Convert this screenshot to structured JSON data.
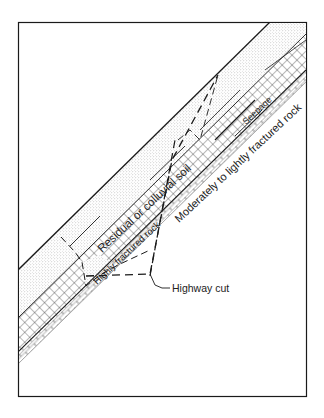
{
  "diagram": {
    "type": "geologic-cross-section",
    "layers": [
      {
        "id": "soil",
        "label": "Residual or colluvial soil",
        "pattern": "stipple"
      },
      {
        "id": "highly-fractured",
        "label": "Highly fractured rock",
        "pattern": "crosshatch"
      },
      {
        "id": "moderately-fractured",
        "label": "Moderately to lightly fractured rock",
        "pattern": "brick"
      }
    ],
    "annotations": {
      "seepage": "Seepage",
      "highway_cut": "Highway cut"
    },
    "colors": {
      "line": "#1a1a1a",
      "stipple": "#bdbdbd",
      "background": "#ffffff"
    }
  }
}
